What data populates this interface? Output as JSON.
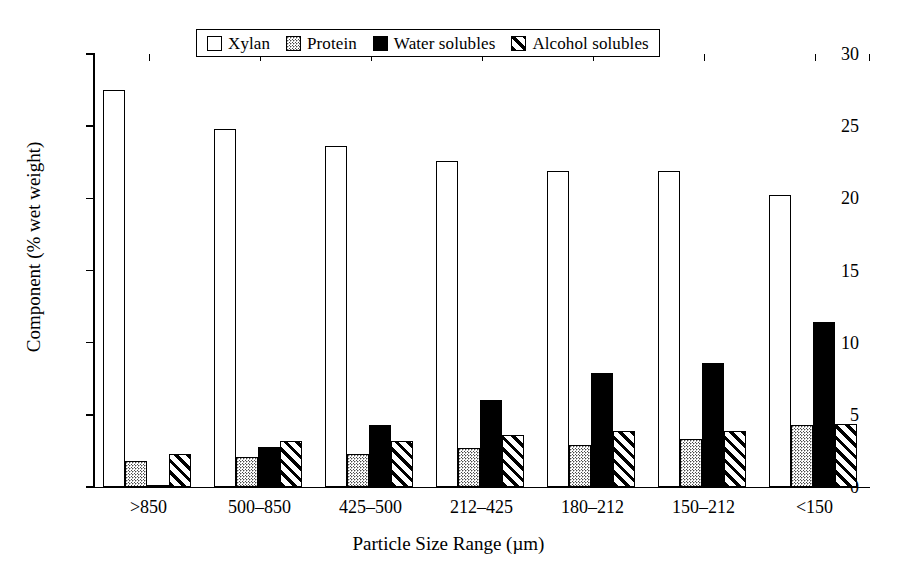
{
  "chart_data": {
    "type": "bar",
    "title": "",
    "xlabel": "Particle Size Range (µm)",
    "ylabel": "Component (% wet weight)",
    "ylim": [
      0,
      30
    ],
    "yticks": [
      0,
      5,
      10,
      15,
      20,
      25,
      30
    ],
    "ytick_labels": [
      "0",
      "5",
      "10",
      "15",
      "20",
      "25",
      "30"
    ],
    "grid": false,
    "legend_position": "top-center",
    "categories": [
      ">850",
      "500–850",
      "425–500",
      "212–425",
      "180–212",
      "150–212",
      "<150"
    ],
    "series": [
      {
        "name": "Xylan",
        "fill": "outline-white",
        "color": "#ffffff",
        "values": [
          27.5,
          24.8,
          23.6,
          22.6,
          21.9,
          21.9,
          20.2
        ]
      },
      {
        "name": "Protein",
        "fill": "stipple-gray",
        "color": "#d8d8d8",
        "values": [
          1.8,
          2.1,
          2.3,
          2.7,
          2.9,
          3.3,
          4.3
        ]
      },
      {
        "name": "Water solubles",
        "fill": "solid-black",
        "color": "#000000",
        "values": [
          0.1,
          2.75,
          4.3,
          6.0,
          7.9,
          8.6,
          11.4
        ]
      },
      {
        "name": "Alcohol solubles",
        "fill": "diagonal-hatch",
        "color": "#ffffff",
        "values": [
          2.3,
          3.2,
          3.2,
          3.6,
          3.9,
          3.9,
          4.4
        ]
      }
    ]
  },
  "legend": {
    "items": [
      {
        "label": "Xylan",
        "swatch": "outline-white"
      },
      {
        "label": "Protein",
        "swatch": "stipple-gray"
      },
      {
        "label": "Water solubles",
        "swatch": "solid-black"
      },
      {
        "label": "Alcohol solubles",
        "swatch": "diagonal-hatch"
      }
    ]
  },
  "axes": {
    "y_title": "Component (% wet weight)",
    "x_title": "Particle Size Range (µm)",
    "y_tick_labels": [
      "30",
      "25",
      "20",
      "15",
      "10",
      "5",
      "0"
    ],
    "x_tick_labels": [
      ">850",
      "500–850",
      "425–500",
      "212–425",
      "180–212",
      "150–212",
      "<150"
    ]
  },
  "style": {
    "axis_color": "#000000",
    "background": "#ffffff",
    "protein_color": "#d8d8d8",
    "water_color": "#000000"
  }
}
